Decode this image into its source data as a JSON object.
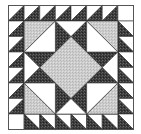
{
  "block": {
    "grid_size": 8,
    "fabrics": {
      "dark": "#3f3f3f",
      "light": "#c8c8c8",
      "white": "#ffffff",
      "line": "#222222"
    },
    "description": "Sawtooth-bordered star block with a light center square-on-point and four corner half-square units"
  }
}
